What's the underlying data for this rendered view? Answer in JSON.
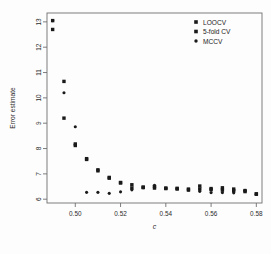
{
  "chart_data": {
    "type": "scatter",
    "title": "",
    "xlabel": "c",
    "ylabel": "Error estimate",
    "xlim": [
      0.4875,
      0.5825
    ],
    "ylim": [
      5.85,
      13.35
    ],
    "grid": false,
    "legend_position": "top-right",
    "xticks": [
      0.5,
      0.52,
      0.54,
      0.56,
      0.58
    ],
    "xtick_labels": [
      "0.50",
      "0.52",
      "0.54",
      "0.56",
      "0.58"
    ],
    "yticks": [
      6,
      7,
      8,
      9,
      10,
      11,
      12,
      13
    ],
    "ytick_labels": [
      "6",
      "7",
      "8",
      "9",
      "10",
      "11",
      "12",
      "13"
    ],
    "series": [
      {
        "name": "LOOCV",
        "marker": "square",
        "color": "#1a1a1a",
        "x": [
          0.49,
          0.495,
          0.5,
          0.505,
          0.51,
          0.515,
          0.52,
          0.525,
          0.53,
          0.535,
          0.54,
          0.545,
          0.55,
          0.555,
          0.56,
          0.565,
          0.57,
          0.575,
          0.58
        ],
        "y": [
          12.7,
          9.2,
          8.12,
          7.57,
          7.12,
          6.83,
          6.64,
          6.57,
          6.48,
          6.5,
          6.44,
          6.43,
          6.4,
          6.4,
          6.38,
          6.36,
          6.33,
          6.3,
          6.2
        ]
      },
      {
        "name": "5-fold CV",
        "marker": "square",
        "color": "#1a1a1a",
        "x": [
          0.49,
          0.495,
          0.5,
          0.505,
          0.51,
          0.515,
          0.52,
          0.525,
          0.53,
          0.535,
          0.54,
          0.545,
          0.55,
          0.555,
          0.56,
          0.565,
          0.57,
          0.575,
          0.58
        ],
        "y": [
          13.05,
          10.65,
          8.18,
          7.6,
          7.16,
          6.86,
          6.66,
          6.44,
          6.46,
          6.44,
          6.42,
          6.4,
          6.36,
          6.52,
          6.42,
          6.45,
          6.4,
          6.34,
          6.21
        ]
      },
      {
        "name": "MCCV",
        "marker": "dot",
        "color": "#1a1a1a",
        "x": [
          0.49,
          0.495,
          0.5,
          0.505,
          0.51,
          0.515,
          0.52,
          0.525,
          0.53,
          0.535,
          0.54,
          0.545,
          0.55,
          0.555,
          0.56,
          0.565,
          0.57,
          0.575,
          0.58
        ],
        "y": [
          13.05,
          10.2,
          8.86,
          6.27,
          6.27,
          6.23,
          6.29,
          6.37,
          6.45,
          6.55,
          6.43,
          6.42,
          6.37,
          6.31,
          6.26,
          6.26,
          6.25,
          6.35,
          6.2
        ]
      }
    ],
    "legend_entries": [
      {
        "label": "LOOCV",
        "marker": "square",
        "color": "#1a1a1a"
      },
      {
        "label": "5-fold CV",
        "marker": "square",
        "color": "#1a1a1a"
      },
      {
        "label": "MCCV",
        "marker": "dot",
        "color": "#1a1a1a"
      }
    ]
  }
}
